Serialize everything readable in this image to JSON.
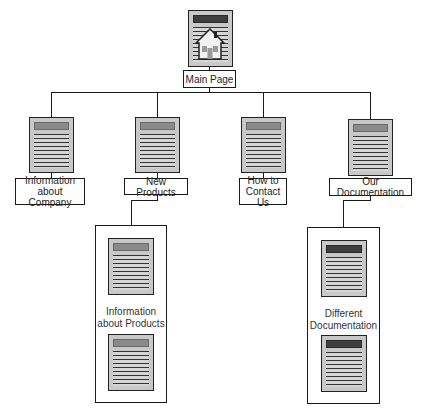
{
  "diagram": {
    "type": "site-map hierarchy",
    "root": {
      "label": "Main Page",
      "icon": "home-page-document-icon"
    },
    "children": [
      {
        "label": "Information\nabout Company",
        "icon": "document-icon"
      },
      {
        "label": "New Products",
        "icon": "document-icon",
        "group": {
          "label": "Information\nabout Products",
          "pages": 2
        }
      },
      {
        "label": "How to\nContact Us",
        "icon": "document-icon"
      },
      {
        "label": "Our Documentation",
        "icon": "document-icon",
        "group": {
          "label": "Different\nDocumentation",
          "pages": 2
        }
      }
    ]
  },
  "colors": {
    "line": "#1a1a1a",
    "doc_fill": "#c8c8c8",
    "doc_header": "#8a8a8a",
    "doc_header_dark": "#3e3e3e",
    "background": "#ffffff"
  }
}
